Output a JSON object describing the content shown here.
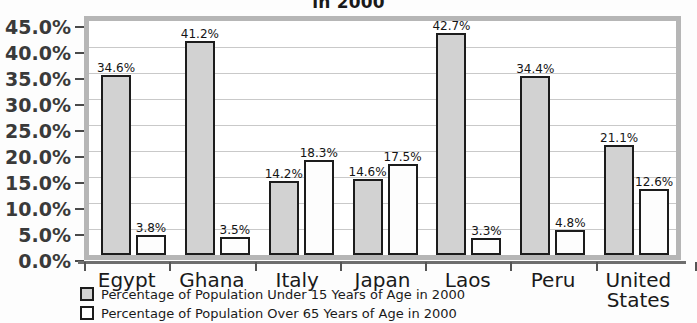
{
  "chart_data": {
    "type": "bar",
    "title": "in 2000",
    "title_note": "Title is clipped by the top edge of the scan; only the final line \"in 2000\" is visible.",
    "xlabel": "",
    "ylabel": "",
    "ylim": [
      0,
      45
    ],
    "ytick_step": 5,
    "grid": true,
    "legend_position": "bottom-left",
    "categories": [
      "Egypt",
      "Ghana",
      "Italy",
      "Japan",
      "Laos",
      "Peru",
      "United\nStates"
    ],
    "ytick_labels": [
      "45.0%",
      "40.0%",
      "35.0%",
      "30.0%",
      "25.0%",
      "20.0%",
      "15.0%",
      "10.0%",
      "5.0%",
      "0.0%"
    ],
    "ytick_values": [
      45,
      40,
      35,
      30,
      25,
      20,
      15,
      10,
      5,
      0
    ],
    "series": [
      {
        "name": "Percentage of Population Under 15 Years of Age in 2000",
        "key": "under15",
        "color": "#d2d2d2",
        "values": [
          34.6,
          41.2,
          14.2,
          14.6,
          42.7,
          34.4,
          21.1
        ],
        "labels": [
          "34.6%",
          "41.2%",
          "14.2%",
          "14.6%",
          "42.7%",
          "34.4%",
          "21.1%"
        ]
      },
      {
        "name": "Percentage of Population Over 65 Years of Age in 2000",
        "key": "over65",
        "color": "#ffffff",
        "values": [
          3.8,
          3.5,
          18.3,
          17.5,
          3.3,
          4.8,
          12.6
        ],
        "labels": [
          "3.8%",
          "3.5%",
          "18.3%",
          "17.5%",
          "3.3%",
          "4.8%",
          "12.6%"
        ]
      }
    ]
  },
  "colors": {
    "bar_under15_fill": "#d2d2d2",
    "bar_over65_fill": "#ffffff",
    "bar_outline": "#1c1c1c",
    "plot_border": "#b6b6b6",
    "gridline": "#c9c9c9",
    "axis": "#6e6e6e",
    "text": "#1a1a1a",
    "background": "#fdfdfd"
  }
}
